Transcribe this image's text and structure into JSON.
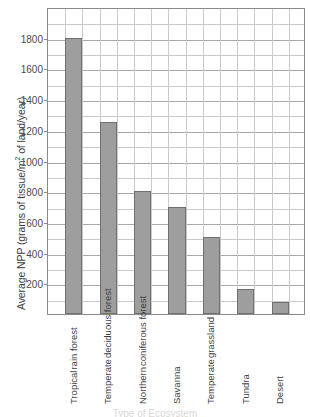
{
  "chart_data": {
    "type": "bar",
    "title": "",
    "xlabel": "Type of Ecosystem",
    "ylabel": "Average NPP (grams of tissue/m² of land/year)",
    "ylabel_prefix": "Average NPP (grams of tissue/m",
    "ylabel_sup": "2",
    "ylabel_suffix": " of land/year)",
    "categories": [
      "Tropical rain forest",
      "Temperate deciduous forest",
      "Northern coniferous forest",
      "Savanna",
      "Temperate grassland",
      "Tundra",
      "Desert"
    ],
    "category_lines": [
      [
        "Tropical",
        "rain forest"
      ],
      [
        "Temperate",
        "deciduous forest"
      ],
      [
        "Northern",
        "coniferous forest"
      ],
      [
        "Savanna",
        ""
      ],
      [
        "Temperate",
        "grassland"
      ],
      [
        "Tundra",
        ""
      ],
      [
        "Desert",
        ""
      ]
    ],
    "values": [
      1800,
      1250,
      800,
      700,
      500,
      160,
      80
    ],
    "ylim": [
      0,
      2000
    ],
    "ytick_values": [
      200,
      400,
      600,
      800,
      1000,
      1200,
      1400,
      1600,
      1800
    ],
    "ytick_labels": [
      "200",
      "400",
      "600",
      "800",
      "1000",
      "1200",
      "1400",
      "1600",
      "1800"
    ],
    "gridline_step": 100,
    "grid": true,
    "grid_vertical": true,
    "legend": false,
    "bar_color": "#9e9e9e",
    "bar_border_color": "#6f6f6f",
    "grid_color": "#c9c9c9",
    "axis_color": "#8a8a8a"
  }
}
